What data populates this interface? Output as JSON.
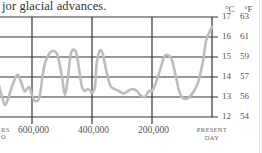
{
  "caption": "jor glacial advances.",
  "units": {
    "celsius": "°C",
    "fahrenheit": "°F"
  },
  "chart_data": {
    "type": "line",
    "title": "",
    "xlabel": "Years ago",
    "ylabel": "Temperature",
    "x_ticks": [
      "600,000",
      "400,000",
      "200,000",
      "PRESENT DAY"
    ],
    "x_ticks_partial_left": [
      "RS",
      "O"
    ],
    "y_ticks_celsius": [
      17,
      16,
      15,
      14,
      13,
      12
    ],
    "y_ticks_fahrenheit": [
      63,
      61,
      59,
      57,
      56,
      54
    ],
    "ylim": [
      12,
      17
    ],
    "grid": true,
    "series": [
      {
        "name": "Global temperature (°C)",
        "x_years_ago": [
          730000,
          715000,
          700000,
          690000,
          680000,
          665000,
          650000,
          640000,
          625000,
          610000,
          600000,
          590000,
          575000,
          560000,
          545000,
          530000,
          515000,
          500000,
          490000,
          480000,
          470000,
          455000,
          445000,
          435000,
          425000,
          415000,
          405000,
          400000,
          390000,
          385000,
          375000,
          365000,
          355000,
          340000,
          325000,
          310000,
          300000,
          290000,
          280000,
          265000,
          250000,
          240000,
          225000,
          210000,
          200000,
          185000,
          170000,
          160000,
          150000,
          135000,
          120000,
          110000,
          100000,
          90000,
          75000,
          60000,
          45000,
          30000,
          20000,
          10000,
          0
        ],
        "values_celsius": [
          14.0,
          13.8,
          13.0,
          12.6,
          12.9,
          13.6,
          14.1,
          13.9,
          13.3,
          13.5,
          13.1,
          12.8,
          13.0,
          14.5,
          15.1,
          15.3,
          15.1,
          14.0,
          13.1,
          14.0,
          15.2,
          15.3,
          14.6,
          13.6,
          13.3,
          13.4,
          13.3,
          13.2,
          13.5,
          14.6,
          15.3,
          15.2,
          14.5,
          13.6,
          13.4,
          13.3,
          13.2,
          13.2,
          13.3,
          13.4,
          13.3,
          13.1,
          13.0,
          13.3,
          13.3,
          13.8,
          14.5,
          15.0,
          15.1,
          14.9,
          14.0,
          13.3,
          13.0,
          12.9,
          13.0,
          13.3,
          13.8,
          14.8,
          15.8,
          16.2,
          16.5
        ]
      }
    ]
  }
}
